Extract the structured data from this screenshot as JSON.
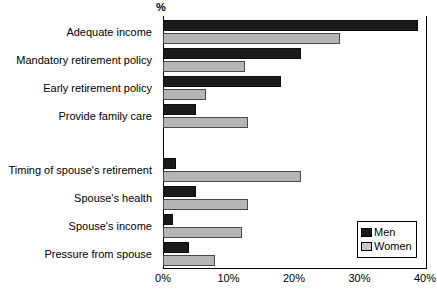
{
  "chart_data": {
    "type": "bar",
    "orientation": "horizontal",
    "title": "",
    "subtitle": "",
    "xlabel": "%",
    "ylabel": "",
    "xlim": [
      0,
      40
    ],
    "xticks": [
      "0%",
      "10%",
      "20%",
      "30%",
      "40%"
    ],
    "xtick_values": [
      0,
      10,
      20,
      30,
      40
    ],
    "grid": false,
    "legend_position": "bottom-right",
    "categories": [
      "Adequate income",
      "Mandatory retirement policy",
      "Early retirement policy",
      "Provide family care",
      "Timing of spouse's retirement",
      "Spouse's health",
      "Spouse's income",
      "Pressure from spouse"
    ],
    "group_break_after_index": 3,
    "series": [
      {
        "name": "Men",
        "color": "#1a1a1a",
        "values": [
          39,
          21,
          18,
          5,
          2,
          5,
          1.5,
          4
        ]
      },
      {
        "name": "Women",
        "color": "#b5b5b5",
        "values": [
          27,
          12.5,
          6.5,
          13,
          21,
          13,
          12,
          8
        ]
      }
    ]
  },
  "axis": {
    "percent_label": "%"
  },
  "legend": {
    "items": [
      {
        "label": "Men",
        "color": "#1a1a1a"
      },
      {
        "label": "Women",
        "color": "#c9c9c9"
      }
    ]
  }
}
